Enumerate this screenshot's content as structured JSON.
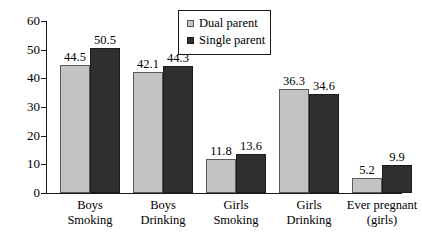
{
  "chart_data": {
    "type": "bar",
    "title": "",
    "subtitle": "",
    "xlabel": "",
    "ylabel": "",
    "ylim": [
      0,
      60
    ],
    "yticks": [
      0,
      10,
      20,
      30,
      40,
      50,
      60
    ],
    "grid": false,
    "legend_position": "top-center",
    "data_labels": true,
    "categories": [
      "Boys\nSmoking",
      "Boys\nDrinking",
      "Girls\nSmoking",
      "Girls\nDrinking",
      "Ever pregnant\n(girls)"
    ],
    "category_lines": [
      [
        "Boys",
        "Smoking"
      ],
      [
        "Boys",
        "Drinking"
      ],
      [
        "Girls",
        "Smoking"
      ],
      [
        "Girls",
        "Drinking"
      ],
      [
        "Ever pregnant",
        "(girls)"
      ]
    ],
    "series": [
      {
        "name": "Dual parent",
        "color": "#c3c3c3",
        "values": [
          44.5,
          42.1,
          11.8,
          36.3,
          5.2
        ],
        "labels": [
          "44.5",
          "42.1",
          "11.8",
          "36.3",
          "5.2"
        ]
      },
      {
        "name": "Single parent",
        "color": "#2f2f2f",
        "values": [
          50.5,
          44.3,
          13.6,
          34.6,
          9.9
        ],
        "labels": [
          "50.5",
          "44.3",
          "13.6",
          "34.6",
          "9.9"
        ]
      }
    ]
  },
  "axis": {
    "y_tick_labels": [
      "60",
      "50",
      "40",
      "30",
      "20",
      "10",
      "0"
    ]
  },
  "legend": {
    "items": [
      {
        "label": "Dual parent",
        "marker": "square-light"
      },
      {
        "label": "Single parent",
        "marker": "square-dark"
      }
    ]
  }
}
